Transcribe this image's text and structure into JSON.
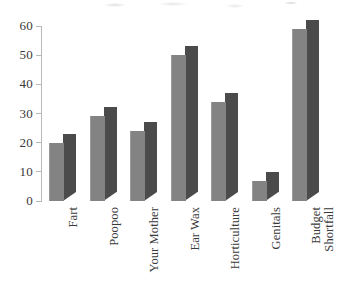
{
  "chart_data": {
    "type": "bar",
    "title": "",
    "subtitle": "",
    "xlabel": "",
    "ylabel": "",
    "categories": [
      "Fart",
      "Poopoo",
      "Your Mother",
      "Ear Wax",
      "Horticulture",
      "Genitals",
      "Budget Shortfall"
    ],
    "values": [
      20,
      29,
      24,
      50,
      34,
      7,
      59
    ],
    "ylim": [
      0,
      60
    ],
    "y_ticks": [
      0,
      10,
      20,
      30,
      40,
      50,
      60
    ],
    "y_tick_labels": [
      "0",
      "10",
      "20",
      "30",
      "40",
      "50",
      "60"
    ],
    "grid": false,
    "legend": false,
    "legend_position": "none",
    "style": "3d-column",
    "annotations": []
  },
  "axis": {
    "y_labels": [
      "60",
      "50",
      "40",
      "30",
      "20",
      "10",
      "0"
    ]
  },
  "bars": [
    {
      "label": "Fart",
      "value": 20,
      "label_lines": "Fart"
    },
    {
      "label": "Poopoo",
      "value": 29,
      "label_lines": "Poopoo"
    },
    {
      "label": "Your Mother",
      "value": 24,
      "label_lines": "Your Mother"
    },
    {
      "label": "Ear Wax",
      "value": 50,
      "label_lines": "Ear Wax"
    },
    {
      "label": "Horticulture",
      "value": 34,
      "label_lines": "Horticulture"
    },
    {
      "label": "Genitals",
      "value": 7,
      "label_lines": "Genitals"
    },
    {
      "label": "Budget Shortfall",
      "value": 59,
      "label_lines": "Budget\nShortfall"
    }
  ],
  "colors": {
    "bar_front": "#838383",
    "bar_side": "#4b4b4b",
    "axis_line": "#b9b9b9",
    "text": "#3a3a3a",
    "background": "#ffffff"
  }
}
